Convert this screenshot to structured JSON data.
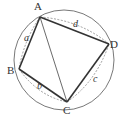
{
  "diagram": {
    "type": "cyclic-quadrilateral",
    "circle": {
      "cx": 64,
      "cy": 60,
      "r": 50
    },
    "vertices": [
      {
        "name": "A",
        "x": 40,
        "y": 17,
        "label_x": 34,
        "label_y": 10
      },
      {
        "name": "B",
        "x": 19,
        "y": 69,
        "label_x": 7,
        "label_y": 74
      },
      {
        "name": "C",
        "x": 67,
        "y": 102,
        "label_x": 63,
        "label_y": 114
      },
      {
        "name": "D",
        "x": 109,
        "y": 44,
        "label_x": 110,
        "label_y": 48
      }
    ],
    "sides": [
      {
        "from": "A",
        "to": "B",
        "label": "a",
        "label_x": 24,
        "label_y": 41
      },
      {
        "from": "B",
        "to": "C",
        "label": "b",
        "label_x": 37,
        "label_y": 89
      },
      {
        "from": "C",
        "to": "D",
        "label": "c",
        "label_x": 93,
        "label_y": 82
      },
      {
        "from": "D",
        "to": "A",
        "label": "d",
        "label_x": 73,
        "label_y": 27
      }
    ],
    "diagonal": {
      "from": "A",
      "to": "C"
    },
    "colors": {
      "stroke": "#333333",
      "circle": "#555555",
      "dashed": "#777777"
    }
  },
  "labels": {
    "A": "A",
    "B": "B",
    "C": "C",
    "D": "D",
    "a": "a",
    "b": "b",
    "c": "c",
    "d": "d"
  }
}
